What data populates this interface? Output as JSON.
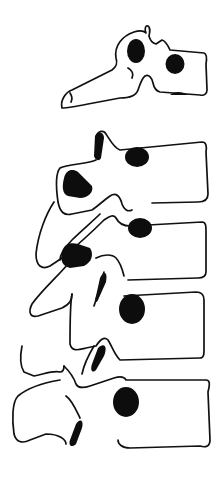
{
  "figure": {
    "vertebrae_count": 5,
    "colors": {
      "line": "#111111",
      "fill": "#0d0d0d",
      "background": "#ffffff"
    }
  }
}
